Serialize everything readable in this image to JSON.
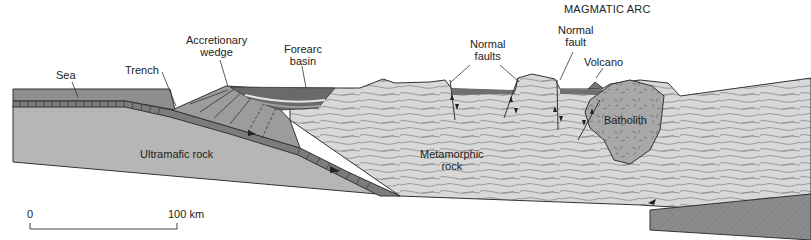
{
  "figure": {
    "title": "MAGMATIC ARC",
    "labels": {
      "sea": "Sea",
      "trench": "Trench",
      "accretionary_wedge_line1": "Accretionary",
      "accretionary_wedge_line2": "wedge",
      "forearc_basin_line1": "Forearc",
      "forearc_basin_line2": "basin",
      "normal_faults_line1": "Normal",
      "normal_faults_line2": "faults",
      "normal_fault_line1": "Normal",
      "normal_fault_line2": "fault",
      "volcano": "Volcano",
      "batholith": "Batholith",
      "ultramafic_rock": "Ultramafic rock",
      "metamorphic_rock_line1": "Metamorphic",
      "metamorphic_rock_line2": "rock"
    },
    "scale_bar": {
      "start_label": "0",
      "end_label": "100 km"
    },
    "colors": {
      "sea": "#8c8c8c",
      "oceanic_crust": "#7a7a7a",
      "ultramafic": "#b4b4b4",
      "metamorphic": "#d6d6d6",
      "batholith": "#a9a9a9",
      "basin_dark": "#6a6a6a",
      "lower_wedge": "#8a8a8a",
      "line": "#333333"
    }
  }
}
